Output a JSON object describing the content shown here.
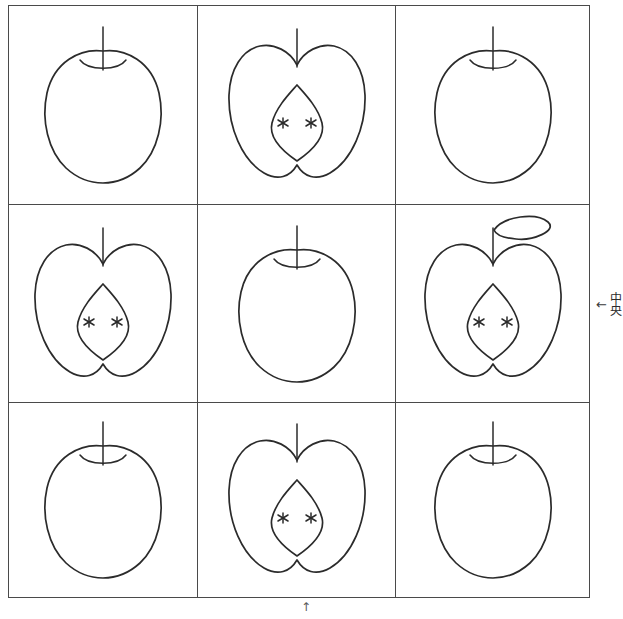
{
  "page": {
    "background_color": "#ffffff",
    "ink_color": "#2b2b2b",
    "border_color": "#4a4a4a"
  },
  "grid": {
    "rows": 3,
    "columns": 3,
    "cells": [
      {
        "position": "row-1-col-1",
        "kind": "whole-apple",
        "label": "whole apple"
      },
      {
        "position": "row-1-col-2",
        "kind": "halved-apple",
        "label": "halved apple with core and seeds"
      },
      {
        "position": "row-1-col-3",
        "kind": "whole-apple",
        "label": "whole apple"
      },
      {
        "position": "row-2-col-1",
        "kind": "halved-apple",
        "label": "halved apple with core and seeds"
      },
      {
        "position": "row-2-col-2",
        "kind": "whole-apple",
        "label": "whole apple"
      },
      {
        "position": "row-2-col-3",
        "kind": "halved-apple-leaf",
        "label": "halved apple with core, seeds and leaf"
      },
      {
        "position": "row-3-col-1",
        "kind": "whole-apple",
        "label": "whole apple"
      },
      {
        "position": "row-3-col-2",
        "kind": "halved-apple",
        "label": "halved apple with core and seeds"
      },
      {
        "position": "row-3-col-3",
        "kind": "whole-apple",
        "label": "whole apple"
      }
    ]
  },
  "annotations": {
    "right": {
      "arrow": "←",
      "text": "中央",
      "icon": "arrow-left-icon"
    },
    "bottom": {
      "arrow": "↑",
      "icon": "arrow-up-icon"
    }
  }
}
